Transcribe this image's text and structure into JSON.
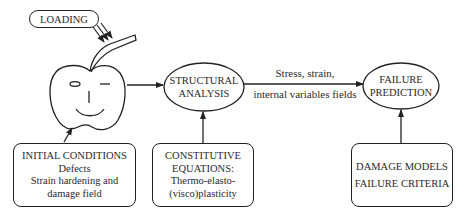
{
  "diagram": {
    "loading": {
      "label": "LOADING"
    },
    "nodes": {
      "structural_analysis": {
        "line1": "STRUCTURAL",
        "line2": "ANALYSIS"
      },
      "failure_prediction": {
        "line1": "FAILURE",
        "line2": "PREDICTION"
      }
    },
    "edge_label": {
      "line1": "Stress, strain,",
      "line2": "internal variables fields"
    },
    "boxes": {
      "initial_conditions": {
        "lines": [
          "INITIAL CONDITIONS",
          "Defects",
          "Strain hardening and",
          "damage field"
        ]
      },
      "constitutive_equations": {
        "lines": [
          "CONSTITUTIVE",
          "EQUATIONS:",
          "Thermo-elasto-",
          "(visco)plasticity"
        ]
      },
      "damage_models": {
        "lines": [
          "DAMAGE MODELS",
          "FAILURE CRITERIA"
        ]
      }
    },
    "icons": {
      "apple": "apple-face-icon"
    }
  }
}
